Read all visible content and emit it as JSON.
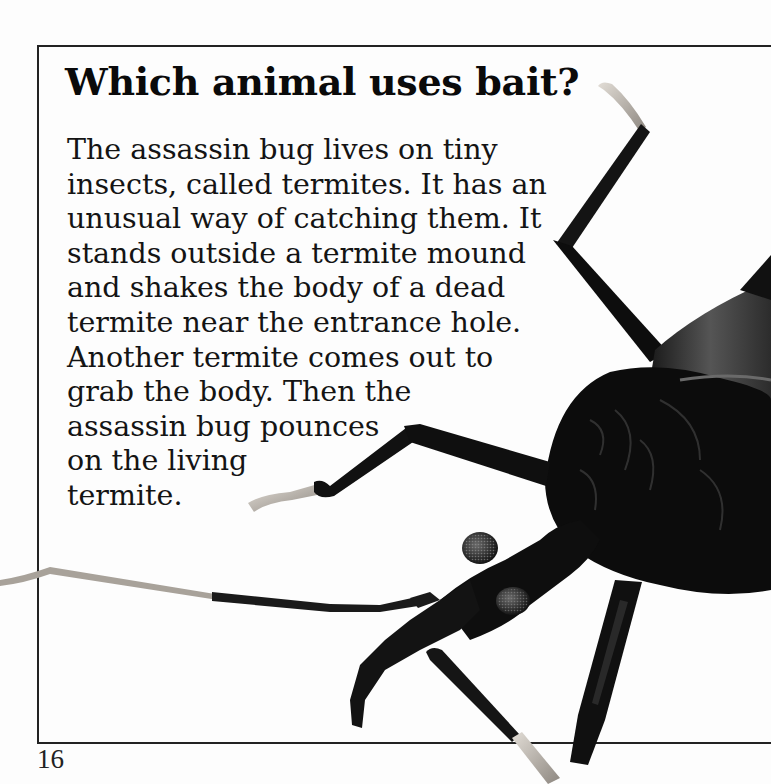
{
  "page": {
    "title": "Which animal uses bait?",
    "body_lines": [
      "The assassin bug lives on tiny",
      "insects, called termites. It has an",
      "unusual way of catching them. It",
      "stands outside a termite mound",
      "and shakes the body of a dead",
      "termite near the entrance hole.",
      "Another termite comes out to",
      "grab the body. Then the",
      "assassin bug pounces",
      "on the living",
      "termite."
    ],
    "page_number": "16",
    "illustration": {
      "subject": "assassin bug",
      "icon": "assassin-bug-photo"
    },
    "colors": {
      "background": "#fdfdfd",
      "text": "#111111",
      "frame": "#222222",
      "bug_dark": "#0c0c0c",
      "bug_mid": "#2a2a2a",
      "leg_tip": "#c9c2b8"
    }
  }
}
